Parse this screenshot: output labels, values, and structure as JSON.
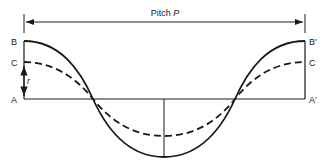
{
  "diagram": {
    "title": "Pitch",
    "title_symbol": "P",
    "labels": {
      "B_left": "B",
      "C_left": "C",
      "A_left": "A",
      "B_right": "B′",
      "C_right": "C",
      "A_right": "A′",
      "r": "r"
    },
    "curves": [
      {
        "name": "solid-wave",
        "style": "solid",
        "description": "full-amplitude cosine wave from B to B′"
      },
      {
        "name": "dashed-wave",
        "style": "dashed",
        "description": "reduced-amplitude cosine wave from C to C"
      }
    ],
    "stroke_color": "#1a1a1a"
  }
}
